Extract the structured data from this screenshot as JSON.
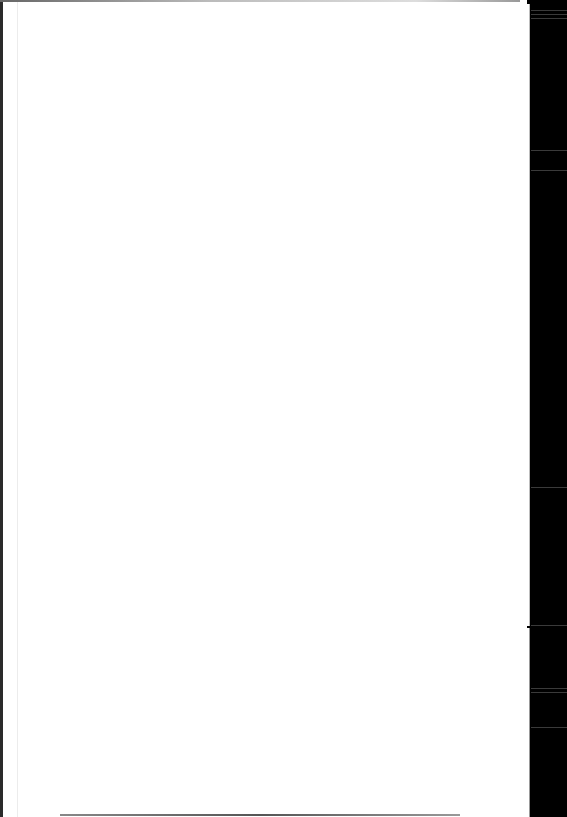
{
  "document": {
    "type": "scanned-page",
    "content": "",
    "colors": {
      "page": "#ffffff",
      "margin": "#000000"
    }
  }
}
